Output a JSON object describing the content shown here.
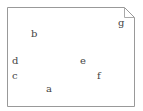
{
  "diagram": {
    "shape": "note-box-with-folded-corner",
    "border_color": "#999999",
    "labels": [
      {
        "text": "a",
        "x": 46,
        "y": 84
      },
      {
        "text": "b",
        "x": 31,
        "y": 29
      },
      {
        "text": "c",
        "x": 12,
        "y": 71
      },
      {
        "text": "d",
        "x": 12,
        "y": 56
      },
      {
        "text": "e",
        "x": 80,
        "y": 56
      },
      {
        "text": "f",
        "x": 97,
        "y": 71
      },
      {
        "text": "g",
        "x": 118,
        "y": 18
      }
    ]
  }
}
